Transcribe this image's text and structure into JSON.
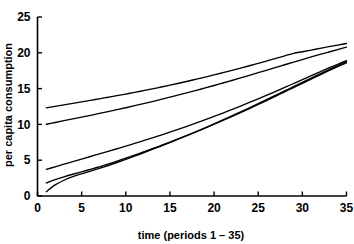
{
  "chart_data": {
    "type": "line",
    "title": "",
    "xlabel": "time (periods 1 – 35)",
    "ylabel": "per capita consumption",
    "xlim": [
      0,
      35
    ],
    "ylim": [
      0,
      25
    ],
    "xticks": [
      0,
      5,
      10,
      15,
      20,
      25,
      30,
      35
    ],
    "yticks": [
      0,
      5,
      10,
      15,
      20,
      25
    ],
    "xtick_labels": [
      "0",
      "5",
      "10",
      "15",
      "20",
      "25",
      "30",
      "35"
    ],
    "ytick_labels": [
      "0",
      "5",
      "10",
      "15",
      "20",
      "25"
    ],
    "grid": false,
    "legend": null,
    "x": [
      1,
      2,
      3,
      4,
      5,
      6,
      7,
      8,
      9,
      10,
      11,
      12,
      13,
      14,
      15,
      16,
      17,
      18,
      19,
      20,
      21,
      22,
      23,
      24,
      25,
      26,
      27,
      28,
      29,
      30,
      31,
      32,
      33,
      34,
      35
    ],
    "series": [
      {
        "name": "curve-1",
        "values": [
          12.3,
          12.52,
          12.73,
          12.94,
          13.15,
          13.36,
          13.57,
          13.79,
          14.01,
          14.24,
          14.47,
          14.71,
          14.96,
          15.22,
          15.48,
          15.75,
          16.03,
          16.32,
          16.61,
          16.91,
          17.22,
          17.54,
          17.86,
          18.19,
          18.53,
          18.87,
          19.22,
          19.57,
          19.93,
          20.15,
          20.38,
          20.62,
          20.85,
          21.08,
          21.3
        ]
      },
      {
        "name": "curve-2",
        "values": [
          10.02,
          10.27,
          10.52,
          10.77,
          11.02,
          11.27,
          11.53,
          11.79,
          12.06,
          12.33,
          12.61,
          12.9,
          13.19,
          13.49,
          13.8,
          14.11,
          14.43,
          14.76,
          15.09,
          15.43,
          15.78,
          16.13,
          16.49,
          16.85,
          17.22,
          17.59,
          17.96,
          18.33,
          18.7,
          19.06,
          19.42,
          19.77,
          20.11,
          20.45,
          20.78
        ]
      },
      {
        "name": "curve-3",
        "values": [
          3.72,
          4.08,
          4.44,
          4.8,
          5.16,
          5.52,
          5.88,
          6.24,
          6.6,
          6.96,
          7.34,
          7.72,
          8.11,
          8.51,
          8.92,
          9.34,
          9.77,
          10.21,
          10.66,
          11.12,
          11.59,
          12.07,
          12.56,
          13.06,
          13.57,
          14.09,
          14.62,
          15.16,
          15.7,
          16.25,
          16.8,
          17.34,
          17.88,
          18.4,
          18.9
        ]
      },
      {
        "name": "curve-4",
        "values": [
          1.82,
          2.28,
          2.68,
          3.04,
          3.38,
          3.72,
          4.08,
          4.46,
          4.86,
          5.28,
          5.71,
          6.15,
          6.6,
          7.06,
          7.53,
          8.01,
          8.5,
          9.0,
          9.51,
          10.03,
          10.56,
          11.1,
          11.65,
          12.21,
          12.78,
          13.36,
          13.95,
          14.55,
          15.15,
          15.74,
          16.33,
          16.92,
          17.5,
          18.06,
          18.6
        ]
      },
      {
        "name": "curve-5",
        "values": [
          0.6,
          1.55,
          2.2,
          2.7,
          3.1,
          3.48,
          3.86,
          4.26,
          4.68,
          5.12,
          5.57,
          6.03,
          6.5,
          6.98,
          7.47,
          7.97,
          8.48,
          9.0,
          9.53,
          10.07,
          10.62,
          11.18,
          11.75,
          12.32,
          12.9,
          13.49,
          14.08,
          14.68,
          15.28,
          15.88,
          16.47,
          17.06,
          17.64,
          18.21,
          18.76
        ]
      }
    ]
  },
  "axes": {
    "x_title": "time (periods 1 – 35)",
    "y_title": "per capita consumption"
  }
}
